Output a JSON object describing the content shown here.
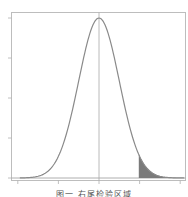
{
  "chart_data": {
    "type": "line",
    "title": "",
    "xlabel": "",
    "ylabel": "",
    "series": [
      {
        "name": "standard normal density",
        "distribution": "normal",
        "mean": 0,
        "sd": 1
      }
    ],
    "x_range": [
      -4.1,
      4.3
    ],
    "xlim": [
      -4.1,
      4.3
    ],
    "ylim": [
      0,
      0.42
    ],
    "x_ticks": [
      -4,
      -2,
      0,
      2,
      4
    ],
    "y_ticks": [
      0,
      0.1,
      0.2,
      0.3,
      0.4
    ],
    "tick_labels_visible": false,
    "vertical_reference_line": 0,
    "shaded_region": {
      "from": 1.96,
      "to": 4.3,
      "description": "right tail area"
    },
    "grid": false,
    "legend": null,
    "colors": {
      "curve": "#8a8a8a",
      "axes": "#b0b0b0",
      "shade": "#7a7a7a",
      "refline": "#a0a0a0"
    }
  },
  "caption": "图一  右尾检验区域"
}
